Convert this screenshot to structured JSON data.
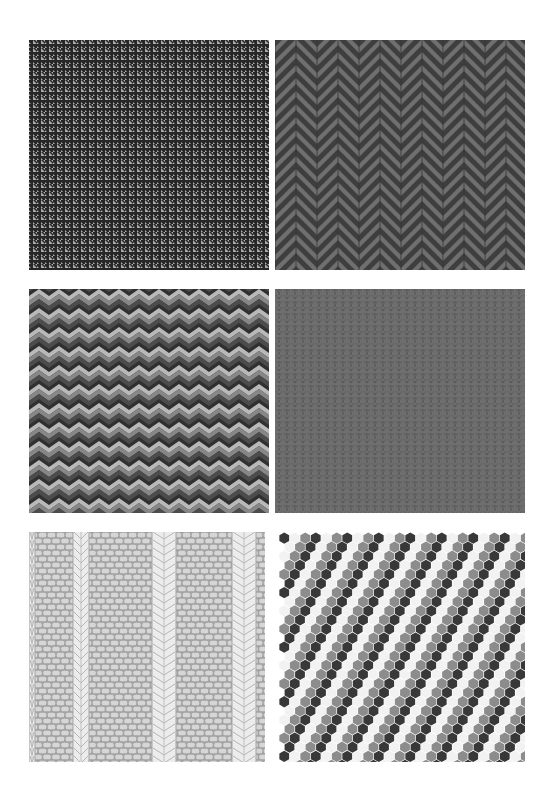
{
  "page": {
    "background": "#ffffff"
  },
  "panels": [
    {
      "id": "houndstooth",
      "label": "Houndstooth pattern swatch",
      "x": 29,
      "y": 40,
      "w": 240,
      "h": 230,
      "colors": {
        "dark": "#262626",
        "light": "#a9a9a9"
      },
      "tile": 8
    },
    {
      "id": "herringbone",
      "label": "Herringbone chevron pattern swatch",
      "x": 275,
      "y": 40,
      "w": 250,
      "h": 230,
      "colors": {
        "dark": "#3e3e3e",
        "light": "#6f6f6f"
      },
      "column_width": 21
    },
    {
      "id": "bargello",
      "label": "Bargello zigzag pattern swatch",
      "x": 29,
      "y": 289,
      "w": 240,
      "h": 224,
      "colors": {
        "light": "#b9b9b9",
        "mid": "#878787",
        "dark": "#4c4c4c",
        "darkest": "#303030"
      },
      "period_x": 20,
      "period_y": 19
    },
    {
      "id": "knit-stockinette",
      "label": "Stockinette knit pattern swatch",
      "x": 275,
      "y": 289,
      "w": 250,
      "h": 224,
      "colors": {
        "base": "#6e6e6e",
        "line": "#555555",
        "stitch": "#5d5d5d"
      },
      "column_width": 8
    },
    {
      "id": "cable-knit",
      "label": "Cable knit pattern swatch",
      "x": 29,
      "y": 532,
      "w": 236,
      "h": 230,
      "colors": {
        "brick": "#d6d6d6",
        "mortar": "#a3a3a3",
        "cable": "#ececec",
        "cable_line": "#b6b6b6"
      }
    },
    {
      "id": "hexagon",
      "label": "Hexagon tile pattern swatch",
      "x": 279,
      "y": 532,
      "w": 246,
      "h": 230,
      "colors": {
        "dark": "#383838",
        "mid": "#8c8c8c",
        "light": "#f2f2f2",
        "gap": "#ffffff"
      },
      "hex_width": 10.5
    }
  ]
}
